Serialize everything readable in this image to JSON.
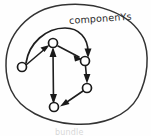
{
  "figure": {
    "kind": "hand-drawn-graph-sketch",
    "background_color": "#fefefe",
    "ink_color": "#1e1e1e",
    "boundary_label": "componenYs",
    "bottom_caption": "bundle",
    "width": 151,
    "height": 136
  },
  "boundary": {
    "name": "component-boundary",
    "shape": "ellipse",
    "cx": 75,
    "cy": 64,
    "rx": 70,
    "ry": 60,
    "stroke_color": "#333333"
  },
  "graph_data": {
    "type": "directed-graph",
    "node_radius": 4.5,
    "nodes": [
      {
        "id": "n1",
        "label": "",
        "x": 22,
        "y": 67
      },
      {
        "id": "n2",
        "label": "",
        "x": 53,
        "y": 43
      },
      {
        "id": "n3",
        "label": "",
        "x": 85,
        "y": 61
      },
      {
        "id": "n4",
        "label": "",
        "x": 87,
        "y": 88
      },
      {
        "id": "n5",
        "label": "",
        "x": 54,
        "y": 107
      }
    ],
    "edges": [
      {
        "from": "n1",
        "to": "n2",
        "style": "straight",
        "arrow": "forward"
      },
      {
        "from": "n1",
        "to": "n3",
        "style": "arc-over-top",
        "arrow": "forward"
      },
      {
        "from": "n2",
        "to": "n3",
        "style": "straight",
        "arrow": "forward"
      },
      {
        "from": "n2",
        "to": "n5",
        "style": "straight",
        "arrow": "both"
      },
      {
        "from": "n3",
        "to": "n4",
        "style": "straight",
        "arrow": "forward"
      },
      {
        "from": "n4",
        "to": "n5",
        "style": "straight",
        "arrow": "forward"
      }
    ]
  }
}
